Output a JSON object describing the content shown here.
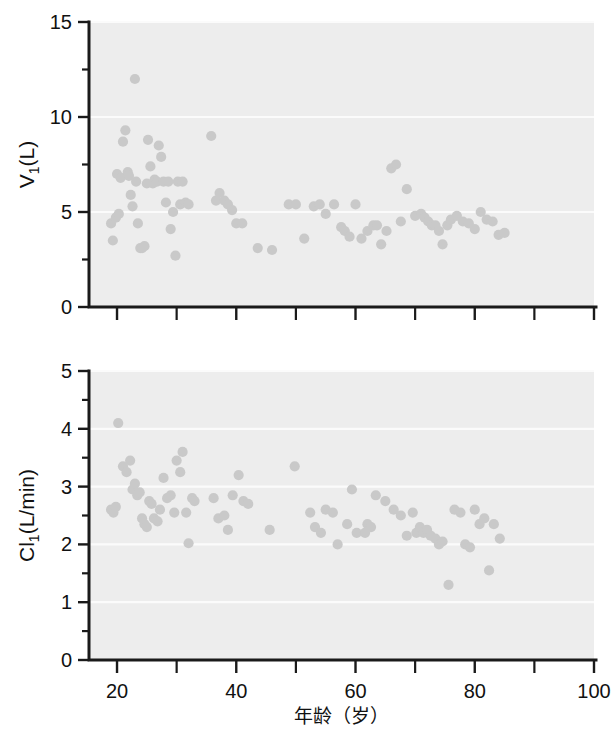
{
  "figure": {
    "background_color": "#ffffff",
    "plot_background_color": "#ededed",
    "point_color": "#c9c9c9",
    "axis_color": "#1a1a1a",
    "gridline_color": "#fbfbfb",
    "xlabel": "年龄（岁）"
  },
  "chart_data": [
    {
      "type": "scatter",
      "panel": "top",
      "title": "",
      "xlabel": "年龄（岁）",
      "ylabel": "V₁(L)",
      "ylabel_main": "V",
      "ylabel_subscript": "1",
      "ylabel_unit": "(L)",
      "xlim": [
        15.3,
        100
      ],
      "ylim": [
        0,
        15
      ],
      "xticks": [
        20,
        30,
        40,
        50,
        60,
        70,
        80,
        90,
        100
      ],
      "xtick_labels": [
        "20",
        "",
        "40",
        "",
        "60",
        "",
        "80",
        "",
        "100"
      ],
      "yticks": [
        0,
        2.5,
        5,
        7.5,
        10,
        12.5,
        15
      ],
      "ytick_labels": [
        "0",
        "",
        "5",
        "",
        "10",
        "",
        "15"
      ],
      "grid": true,
      "legend": "none",
      "x": [
        19.0,
        19.3,
        19.8,
        20.0,
        20.3,
        20.6,
        21.0,
        21.4,
        21.8,
        22.0,
        22.3,
        22.6,
        23.0,
        23.2,
        23.5,
        23.9,
        24.2,
        24.6,
        25.0,
        25.2,
        25.6,
        26.0,
        26.3,
        26.7,
        27.0,
        27.4,
        27.8,
        28.2,
        28.6,
        29.0,
        29.4,
        29.8,
        30.2,
        30.6,
        31.0,
        31.5,
        32.0,
        35.8,
        36.6,
        37.2,
        38.0,
        38.6,
        39.3,
        40.0,
        41.0,
        43.6,
        46.0,
        48.8,
        50.0,
        51.4,
        53.0,
        54.0,
        55.0,
        56.4,
        57.6,
        58.2,
        59.0,
        60.0,
        61.0,
        62.0,
        63.0,
        63.6,
        64.3,
        65.2,
        66.0,
        66.8,
        67.6,
        68.6,
        70.0,
        71.0,
        71.6,
        72.2,
        72.8,
        73.4,
        74.0,
        74.6,
        75.4,
        76.0,
        77.0,
        78.0,
        79.0,
        80.0,
        81.0,
        82.0,
        83.0,
        84.0,
        85.0
      ],
      "y": [
        4.4,
        3.5,
        4.7,
        7.0,
        4.9,
        6.8,
        8.7,
        9.3,
        7.1,
        6.9,
        5.9,
        5.3,
        12.0,
        6.6,
        4.4,
        3.1,
        3.1,
        3.2,
        6.5,
        8.8,
        7.4,
        6.5,
        6.7,
        6.6,
        8.5,
        7.9,
        6.6,
        5.5,
        6.6,
        4.1,
        5.0,
        2.7,
        6.6,
        5.4,
        6.6,
        5.5,
        5.4,
        9.0,
        5.6,
        6.0,
        5.6,
        5.4,
        5.1,
        4.4,
        4.4,
        3.1,
        3.0,
        5.4,
        5.4,
        3.6,
        5.3,
        5.4,
        4.9,
        5.4,
        4.2,
        4.0,
        3.7,
        5.4,
        3.6,
        4.0,
        4.3,
        4.3,
        3.3,
        4.0,
        7.3,
        7.5,
        4.5,
        6.2,
        4.8,
        4.9,
        4.7,
        4.5,
        4.3,
        4.3,
        4.0,
        3.3,
        4.3,
        4.6,
        4.8,
        4.5,
        4.4,
        4.1,
        5.0,
        4.6,
        4.5,
        3.8,
        3.9
      ]
    },
    {
      "type": "scatter",
      "panel": "bottom",
      "title": "",
      "xlabel": "年龄（岁）",
      "ylabel": "Cl₁(L/min)",
      "ylabel_main": "Cl",
      "ylabel_subscript": "1",
      "ylabel_unit": "(L/min)",
      "xlim": [
        15.3,
        100
      ],
      "ylim": [
        0,
        5
      ],
      "xticks": [
        20,
        30,
        40,
        50,
        60,
        70,
        80,
        90,
        100
      ],
      "xtick_labels": [
        "20",
        "",
        "40",
        "",
        "60",
        "",
        "80",
        "",
        "100"
      ],
      "yticks": [
        0,
        0.5,
        1,
        1.5,
        2,
        2.5,
        3,
        3.5,
        4,
        4.5,
        5
      ],
      "ytick_labels": [
        "0",
        "",
        "1",
        "",
        "2",
        "",
        "3",
        "",
        "4",
        "",
        "5"
      ],
      "grid": true,
      "legend": "none",
      "x": [
        19.0,
        19.4,
        19.8,
        20.2,
        21.0,
        21.6,
        22.2,
        22.6,
        23.0,
        23.4,
        23.8,
        24.2,
        24.6,
        25.0,
        25.4,
        25.8,
        26.2,
        26.8,
        27.2,
        27.8,
        28.4,
        29.0,
        29.6,
        30.0,
        30.6,
        31.0,
        31.6,
        32.0,
        32.6,
        33.0,
        36.2,
        37.0,
        38.0,
        38.6,
        39.4,
        40.4,
        41.2,
        42.0,
        45.6,
        49.8,
        52.4,
        53.2,
        54.2,
        55.0,
        56.2,
        57.0,
        58.6,
        59.4,
        60.2,
        61.6,
        62.0,
        62.6,
        63.4,
        65.0,
        66.4,
        67.6,
        68.6,
        69.6,
        70.2,
        70.8,
        71.4,
        72.0,
        72.6,
        73.4,
        74.0,
        74.6,
        75.6,
        76.6,
        77.6,
        78.4,
        79.2,
        80.0,
        80.8,
        81.6,
        82.4,
        83.2,
        84.2
      ],
      "y": [
        2.6,
        2.55,
        2.65,
        4.1,
        3.35,
        3.25,
        3.45,
        2.95,
        3.05,
        2.85,
        2.9,
        2.45,
        2.35,
        2.3,
        2.75,
        2.7,
        2.45,
        2.4,
        2.6,
        3.15,
        2.8,
        2.85,
        2.55,
        3.45,
        3.25,
        3.6,
        2.55,
        2.02,
        2.8,
        2.75,
        2.8,
        2.45,
        2.5,
        2.25,
        2.85,
        3.2,
        2.75,
        2.7,
        2.25,
        3.35,
        2.55,
        2.3,
        2.2,
        2.6,
        2.55,
        2.0,
        2.35,
        2.95,
        2.2,
        2.2,
        2.35,
        2.3,
        2.85,
        2.75,
        2.6,
        2.5,
        2.15,
        2.55,
        2.2,
        2.3,
        2.2,
        2.25,
        2.15,
        2.1,
        2.0,
        2.05,
        1.3,
        2.6,
        2.55,
        2.0,
        1.95,
        2.6,
        2.35,
        2.45,
        1.55,
        2.35,
        2.1
      ]
    }
  ]
}
